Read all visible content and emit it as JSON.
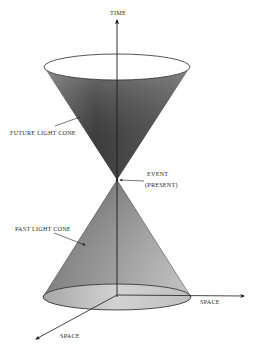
{
  "diagram": {
    "labels": {
      "time_axis": "TIME",
      "future_cone": "FUTURE LIGHT CONE",
      "event_line1": "EVENT",
      "event_line2": "(PRESENT)",
      "past_cone": "PAST LIGHT CONE",
      "space_axis_right": "SPACE",
      "space_axis_diagonal": "SPACE"
    },
    "colors": {
      "cone_dark": "#4a4a4a",
      "cone_mid": "#7a7a7a",
      "cone_light": "#b5b5b5",
      "ellipse_top_fill": "#ffffff",
      "ellipse_bottom_fill": "#c8c8c8",
      "axis": "#1a1a1a",
      "background": "#ffffff"
    }
  }
}
